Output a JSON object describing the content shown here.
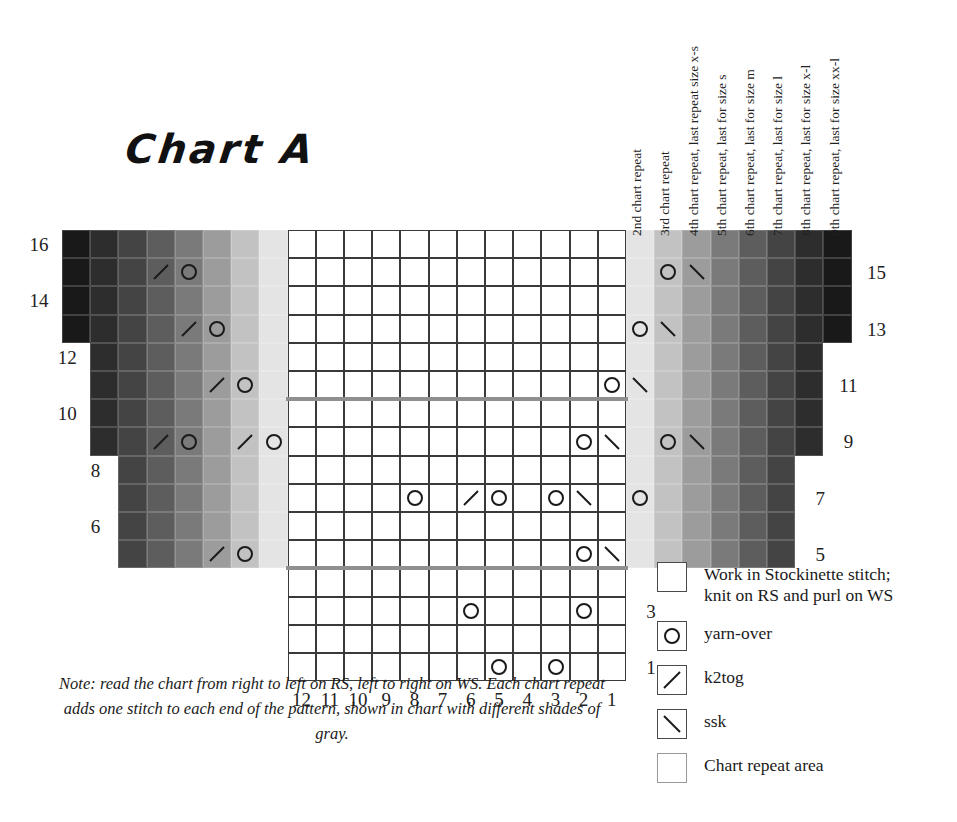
{
  "title": "Chart A",
  "geometry": {
    "x0": 62,
    "y0": 230,
    "cw": 28.2,
    "ch": 28.2,
    "cols": 28,
    "rows": 16
  },
  "chart_data": {
    "type": "table",
    "title": "Chart A",
    "grid_cols": 28,
    "grid_rows": 16,
    "center_repeat_cols": 12,
    "row_labels_left": [
      16,
      14,
      12,
      10,
      8,
      6
    ],
    "row_labels_right": [
      15,
      13,
      11,
      9,
      7,
      5,
      3,
      1
    ],
    "col_labels_bottom": [
      12,
      11,
      10,
      9,
      8,
      7,
      6,
      5,
      4,
      3,
      2,
      1
    ],
    "gray_shades": [
      "#191919",
      "#2d2d2d",
      "#444444",
      "#5d5d5d",
      "#7a7a7a",
      "#9c9c9c",
      "#c2c2c2",
      "#e4e4e4"
    ],
    "rows": [
      {
        "row": 16,
        "left_gray": 8,
        "right_gray": 8,
        "symbols": []
      },
      {
        "row": 15,
        "left_gray": 8,
        "right_gray": 8,
        "symbols": [
          {
            "col": 22,
            "sym": "ssk"
          },
          {
            "col": 21,
            "sym": "yo"
          },
          {
            "col": 4,
            "sym": "yo"
          },
          {
            "col": 3,
            "sym": "k2tog"
          }
        ]
      },
      {
        "row": 14,
        "left_gray": 8,
        "right_gray": 8,
        "symbols": []
      },
      {
        "row": 13,
        "left_gray": 8,
        "right_gray": 8,
        "symbols": [
          {
            "col": 21,
            "sym": "ssk"
          },
          {
            "col": 20,
            "sym": "yo"
          },
          {
            "col": 5,
            "sym": "yo"
          },
          {
            "col": 4,
            "sym": "k2tog"
          }
        ]
      },
      {
        "row": 12,
        "left_gray": 7,
        "right_gray": 7,
        "symbols": []
      },
      {
        "row": 11,
        "left_gray": 7,
        "right_gray": 7,
        "symbols": [
          {
            "col": 20,
            "sym": "ssk"
          },
          {
            "col": 19,
            "sym": "yo"
          },
          {
            "col": 6,
            "sym": "yo"
          },
          {
            "col": 5,
            "sym": "k2tog"
          }
        ]
      },
      {
        "row": 10,
        "left_gray": 7,
        "right_gray": 7,
        "symbols": []
      },
      {
        "row": 9,
        "left_gray": 7,
        "right_gray": 7,
        "symbols": [
          {
            "col": 22,
            "sym": "ssk"
          },
          {
            "col": 21,
            "sym": "yo"
          },
          {
            "col": 19,
            "sym": "ssk"
          },
          {
            "col": 18,
            "sym": "yo"
          },
          {
            "col": 7,
            "sym": "yo"
          },
          {
            "col": 6,
            "sym": "k2tog"
          },
          {
            "col": 4,
            "sym": "yo"
          },
          {
            "col": 3,
            "sym": "k2tog"
          }
        ]
      },
      {
        "row": 8,
        "left_gray": 6,
        "right_gray": 6,
        "symbols": []
      },
      {
        "row": 7,
        "left_gray": 6,
        "right_gray": 6,
        "symbols": [
          {
            "col": 20,
            "sym": "yo"
          },
          {
            "col": 18,
            "sym": "ssk"
          },
          {
            "col": 17,
            "sym": "yo"
          },
          {
            "col": 15,
            "sym": "yo"
          },
          {
            "col": 14,
            "sym": "k2tog"
          },
          {
            "col": 12,
            "sym": "yo"
          }
        ]
      },
      {
        "row": 6,
        "left_gray": 6,
        "right_gray": 6,
        "symbols": []
      },
      {
        "row": 5,
        "left_gray": 6,
        "right_gray": 6,
        "symbols": [
          {
            "col": 19,
            "sym": "ssk"
          },
          {
            "col": 18,
            "sym": "yo"
          },
          {
            "col": 6,
            "sym": "yo"
          },
          {
            "col": 5,
            "sym": "k2tog"
          }
        ]
      },
      {
        "row": 4,
        "left_gray": 0,
        "right_gray": 0,
        "symbols": []
      },
      {
        "row": 3,
        "left_gray": 0,
        "right_gray": 0,
        "symbols": [
          {
            "col": 18,
            "sym": "yo"
          },
          {
            "col": 14,
            "sym": "yo"
          }
        ]
      },
      {
        "row": 2,
        "left_gray": 0,
        "right_gray": 0,
        "symbols": []
      },
      {
        "row": 1,
        "left_gray": 0,
        "right_gray": 0,
        "symbols": [
          {
            "col": 17,
            "sym": "yo"
          },
          {
            "col": 15,
            "sym": "yo"
          }
        ]
      }
    ]
  },
  "repeat_labels": [
    "2nd chart repeat",
    "3rd chart repeat",
    "4th chart repeat, last repeat size x-s",
    "5th chart repeat, last for size s",
    "6th chart repeat, last for size m",
    "7th chart repeat, last for size l",
    "8th chart repeat, last for size x-l",
    "9th chart repeat, last for size xx-l"
  ],
  "legend": {
    "items": [
      {
        "icon": "empty-square-icon",
        "label": "Work in Stockinette stitch;\nknit on RS and purl on WS"
      },
      {
        "icon": "yarn-over-icon",
        "label": "yarn-over"
      },
      {
        "icon": "k2tog-icon",
        "label": "k2tog"
      },
      {
        "icon": "ssk-icon",
        "label": "ssk"
      },
      {
        "icon": "chart-repeat-icon",
        "label": "Chart repeat area"
      }
    ]
  },
  "note": "Note: read the chart from right to left on RS, left to right on WS. Each chart repeat adds one stitch to each end of the pattern, shown in chart with different shades of gray.",
  "colors": {
    "grid_line": "#3a3a3a",
    "repeat_rule": "#8f8f8f",
    "text": "#1a1a1a"
  }
}
